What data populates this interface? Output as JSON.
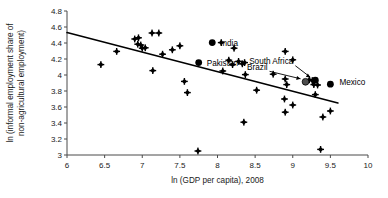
{
  "chart_data": {
    "type": "scatter",
    "title": "",
    "xlabel": "ln (GDP per capita), 2008",
    "ylabel": "ln (informal employment share of non-agricultural employment)",
    "xlim": [
      6,
      10
    ],
    "ylim": [
      3,
      4.8
    ],
    "grid": false,
    "legend": null,
    "xticks": [
      "6",
      "6.5",
      "7",
      "7.5",
      "8",
      "8.5",
      "9",
      "9.5",
      "10"
    ],
    "xtick_values": [
      6,
      6.5,
      7,
      7.5,
      8,
      8.5,
      9,
      9.5,
      10
    ],
    "yticks": [
      "3",
      "3.2",
      "3.4",
      "3.6",
      "3.8",
      "4",
      "4.2",
      "4.4",
      "4.6",
      "4.8"
    ],
    "ytick_values": [
      3,
      3.2,
      3.4,
      3.6,
      3.8,
      4,
      4.2,
      4.4,
      4.6,
      4.8
    ],
    "trendline": {
      "x": [
        6.0,
        9.6
      ],
      "y": [
        4.53,
        3.65
      ],
      "style": "solid"
    },
    "points": [
      {
        "x": 6.45,
        "y": 4.13
      },
      {
        "x": 6.66,
        "y": 4.295
      },
      {
        "x": 6.9,
        "y": 4.45
      },
      {
        "x": 6.95,
        "y": 4.465
      },
      {
        "x": 6.94,
        "y": 4.385
      },
      {
        "x": 6.98,
        "y": 4.375
      },
      {
        "x": 7.0,
        "y": 4.335
      },
      {
        "x": 7.04,
        "y": 4.34
      },
      {
        "x": 7.13,
        "y": 4.525
      },
      {
        "x": 7.22,
        "y": 4.525
      },
      {
        "x": 7.14,
        "y": 4.055
      },
      {
        "x": 7.27,
        "y": 4.26
      },
      {
        "x": 7.4,
        "y": 4.315
      },
      {
        "x": 7.5,
        "y": 4.365
      },
      {
        "x": 7.56,
        "y": 3.92
      },
      {
        "x": 7.6,
        "y": 3.78
      },
      {
        "x": 7.74,
        "y": 3.05
      },
      {
        "x": 8.05,
        "y": 4.405
      },
      {
        "x": 8.07,
        "y": 4.05
      },
      {
        "x": 8.15,
        "y": 4.185
      },
      {
        "x": 8.2,
        "y": 4.13
      },
      {
        "x": 8.22,
        "y": 4.335
      },
      {
        "x": 8.28,
        "y": 4.17
      },
      {
        "x": 8.33,
        "y": 4.14
      },
      {
        "x": 8.36,
        "y": 4.155
      },
      {
        "x": 8.37,
        "y": 4.005
      },
      {
        "x": 8.35,
        "y": 3.41
      },
      {
        "x": 8.52,
        "y": 3.81
      },
      {
        "x": 8.74,
        "y": 4.01
      },
      {
        "x": 8.9,
        "y": 4.295
      },
      {
        "x": 8.9,
        "y": 3.95
      },
      {
        "x": 8.92,
        "y": 3.88
      },
      {
        "x": 8.89,
        "y": 3.7
      },
      {
        "x": 8.9,
        "y": 3.535
      },
      {
        "x": 9.0,
        "y": 4.19
      },
      {
        "x": 9.0,
        "y": 3.625
      },
      {
        "x": 9.22,
        "y": 3.94
      },
      {
        "x": 9.26,
        "y": 3.93
      },
      {
        "x": 9.28,
        "y": 3.88
      },
      {
        "x": 9.3,
        "y": 3.755
      },
      {
        "x": 9.33,
        "y": 3.875
      },
      {
        "x": 9.37,
        "y": 3.07
      },
      {
        "x": 9.4,
        "y": 3.475
      },
      {
        "x": 9.5,
        "y": 3.55
      }
    ],
    "highlighted": [
      {
        "label": "India",
        "x": 7.93,
        "y": 4.405,
        "marker": "filled",
        "label_dx": 8,
        "label_dy": 3,
        "leader": false
      },
      {
        "label": "Pakistan",
        "x": 7.75,
        "y": 4.155,
        "marker": "filled",
        "label_dx": 8,
        "label_dy": 3,
        "leader": false
      },
      {
        "label": "Brazil",
        "x": 9.17,
        "y": 3.915,
        "marker": "hollow",
        "label_dx": -38,
        "label_dy": -12,
        "leader": true
      },
      {
        "label": "South Africa",
        "x": 9.3,
        "y": 3.935,
        "marker": "filled",
        "label_dx": -22,
        "label_dy": -16,
        "leader": true
      },
      {
        "label": "Mexico",
        "x": 9.5,
        "y": 3.885,
        "marker": "filled",
        "label_dx": 9,
        "label_dy": 1,
        "leader": false
      }
    ],
    "colors": {
      "point": "#000000",
      "trendline": "#000000",
      "axis": "#4a4a4a",
      "text": "#1a1a1a",
      "background": "#ffffff",
      "brazil_marker": "#4d4d4d"
    }
  }
}
